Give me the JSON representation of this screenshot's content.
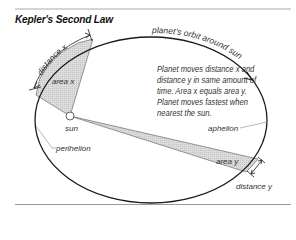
{
  "title": "Kepler's Second Law",
  "description": "Planet moves distance x and distance y in same amount of time. Area x equals area y. Planet moves fastest when nearest the sun.",
  "labels": {
    "orbit": "planet's orbit around sun",
    "distance_x": "distance x",
    "area_x": "area x",
    "area_y": "area y",
    "distance_y": "distance y",
    "sun": "sun",
    "perihelion": "perihelion",
    "aphelion": "aphelion"
  },
  "colors": {
    "orbit_line": "#1a1a1a",
    "area_fill": "#d6d6d6",
    "leader_line": "#9a9a9a",
    "rule": "#c8c8c8"
  }
}
